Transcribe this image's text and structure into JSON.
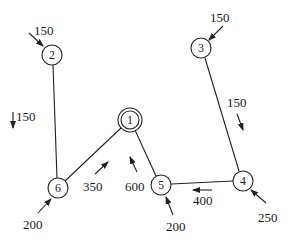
{
  "diagram": {
    "type": "network-flow",
    "stroke_color": "#222222",
    "nodes": [
      {
        "id": "1",
        "label": "1",
        "x": 130,
        "y": 120,
        "double": true
      },
      {
        "id": "2",
        "label": "2",
        "x": 52,
        "y": 55,
        "double": false
      },
      {
        "id": "3",
        "label": "3",
        "x": 201,
        "y": 48,
        "double": false
      },
      {
        "id": "4",
        "label": "4",
        "x": 243,
        "y": 181,
        "double": false
      },
      {
        "id": "5",
        "label": "5",
        "x": 161,
        "y": 185,
        "double": false
      },
      {
        "id": "6",
        "label": "6",
        "x": 58,
        "y": 188,
        "double": false
      }
    ],
    "edges": [
      {
        "from": "2",
        "to": "6"
      },
      {
        "from": "6",
        "to": "1"
      },
      {
        "from": "1",
        "to": "5"
      },
      {
        "from": "5",
        "to": "4"
      },
      {
        "from": "3",
        "to": "4"
      }
    ],
    "external_flows": [
      {
        "node": "2",
        "value": "150"
      },
      {
        "node": "3",
        "value": "150"
      },
      {
        "node": "4",
        "value": "250"
      },
      {
        "node": "5",
        "value": "200"
      },
      {
        "node": "6",
        "value": "200"
      }
    ],
    "edge_flows": [
      {
        "edge": "2-6",
        "value": "150"
      },
      {
        "edge": "3-4",
        "value": "150"
      },
      {
        "edge": "6-1",
        "value": "350"
      },
      {
        "edge": "5-1",
        "value": "600"
      },
      {
        "edge": "4-5",
        "value": "400"
      }
    ]
  }
}
